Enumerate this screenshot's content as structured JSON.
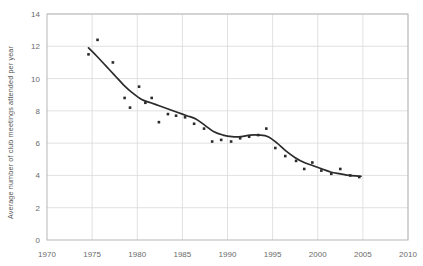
{
  "chart_data": {
    "type": "scatter",
    "title": "",
    "xlabel": "",
    "ylabel": "Average number of club meetings attended per year",
    "xlim": [
      1970,
      2010
    ],
    "ylim": [
      0,
      14
    ],
    "xticks": [
      1970,
      1975,
      1980,
      1985,
      1990,
      1995,
      2000,
      2005,
      2010
    ],
    "yticks": [
      0,
      2,
      4,
      6,
      8,
      10,
      12,
      14
    ],
    "grid": true,
    "legend": "none",
    "marker_color": "#2b2b2b",
    "line_color": "#2b2b2b",
    "grid_color": "#d9d9d9",
    "axis_color": "#b0b0b0",
    "points": [
      {
        "x": 1974.6,
        "y": 11.5
      },
      {
        "x": 1975.6,
        "y": 12.4
      },
      {
        "x": 1977.3,
        "y": 11.0
      },
      {
        "x": 1978.6,
        "y": 8.8
      },
      {
        "x": 1979.2,
        "y": 8.2
      },
      {
        "x": 1980.2,
        "y": 9.5
      },
      {
        "x": 1980.9,
        "y": 8.5
      },
      {
        "x": 1981.6,
        "y": 8.8
      },
      {
        "x": 1982.4,
        "y": 7.3
      },
      {
        "x": 1983.4,
        "y": 7.8
      },
      {
        "x": 1984.3,
        "y": 7.7
      },
      {
        "x": 1985.3,
        "y": 7.6
      },
      {
        "x": 1986.3,
        "y": 7.2
      },
      {
        "x": 1987.4,
        "y": 6.9
      },
      {
        "x": 1988.3,
        "y": 6.1
      },
      {
        "x": 1989.3,
        "y": 6.2
      },
      {
        "x": 1990.4,
        "y": 6.1
      },
      {
        "x": 1991.4,
        "y": 6.3
      },
      {
        "x": 1992.4,
        "y": 6.4
      },
      {
        "x": 1993.4,
        "y": 6.5
      },
      {
        "x": 1994.3,
        "y": 6.9
      },
      {
        "x": 1995.3,
        "y": 5.7
      },
      {
        "x": 1996.4,
        "y": 5.2
      },
      {
        "x": 1997.6,
        "y": 4.9
      },
      {
        "x": 1998.5,
        "y": 4.4
      },
      {
        "x": 1999.4,
        "y": 4.8
      },
      {
        "x": 2000.4,
        "y": 4.3
      },
      {
        "x": 2001.5,
        "y": 4.1
      },
      {
        "x": 2002.5,
        "y": 4.4
      },
      {
        "x": 2003.6,
        "y": 4.0
      },
      {
        "x": 2004.6,
        "y": 3.9
      }
    ],
    "trend_line": [
      {
        "x": 1974.6,
        "y": 11.9
      },
      {
        "x": 1975.5,
        "y": 11.4
      },
      {
        "x": 1976.5,
        "y": 10.8
      },
      {
        "x": 1977.5,
        "y": 10.2
      },
      {
        "x": 1978.5,
        "y": 9.6
      },
      {
        "x": 1979.5,
        "y": 9.1
      },
      {
        "x": 1980.5,
        "y": 8.7
      },
      {
        "x": 1981.5,
        "y": 8.5
      },
      {
        "x": 1982.5,
        "y": 8.3
      },
      {
        "x": 1983.5,
        "y": 8.1
      },
      {
        "x": 1984.5,
        "y": 7.9
      },
      {
        "x": 1985.5,
        "y": 7.7
      },
      {
        "x": 1986.5,
        "y": 7.5
      },
      {
        "x": 1987.5,
        "y": 7.1
      },
      {
        "x": 1988.5,
        "y": 6.7
      },
      {
        "x": 1989.5,
        "y": 6.5
      },
      {
        "x": 1990.5,
        "y": 6.4
      },
      {
        "x": 1991.5,
        "y": 6.4
      },
      {
        "x": 1992.5,
        "y": 6.5
      },
      {
        "x": 1993.5,
        "y": 6.5
      },
      {
        "x": 1994.5,
        "y": 6.4
      },
      {
        "x": 1995.5,
        "y": 6.0
      },
      {
        "x": 1996.5,
        "y": 5.5
      },
      {
        "x": 1997.5,
        "y": 5.1
      },
      {
        "x": 1998.5,
        "y": 4.8
      },
      {
        "x": 1999.5,
        "y": 4.6
      },
      {
        "x": 2000.5,
        "y": 4.4
      },
      {
        "x": 2001.5,
        "y": 4.2
      },
      {
        "x": 2002.5,
        "y": 4.1
      },
      {
        "x": 2003.5,
        "y": 4.0
      },
      {
        "x": 2004.8,
        "y": 3.95
      }
    ]
  }
}
